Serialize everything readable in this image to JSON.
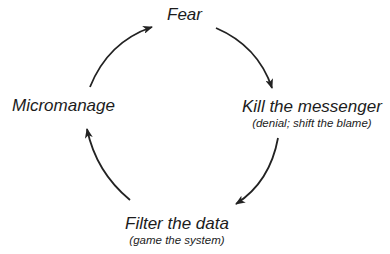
{
  "diagram": {
    "type": "cycle",
    "nodes": [
      {
        "id": "fear",
        "title": "Fear",
        "subtitle": ""
      },
      {
        "id": "kill",
        "title": "Kill the messenger",
        "subtitle": "(denial; shift the blame)"
      },
      {
        "id": "filter",
        "title": "Filter the data",
        "subtitle": "(game the system)"
      },
      {
        "id": "micro",
        "title": "Micromanage",
        "subtitle": ""
      }
    ],
    "edges": [
      {
        "from": "fear",
        "to": "kill"
      },
      {
        "from": "kill",
        "to": "filter"
      },
      {
        "from": "filter",
        "to": "micro"
      },
      {
        "from": "micro",
        "to": "fear"
      }
    ],
    "colors": {
      "stroke": "#222222",
      "text": "#1c1c1c",
      "background": "#ffffff"
    }
  }
}
